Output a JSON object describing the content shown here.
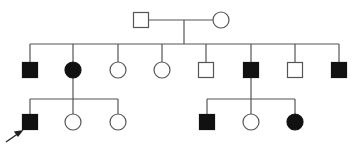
{
  "diagram": {
    "type": "pedigree",
    "colors": {
      "line": "#555555",
      "affected": "#111111",
      "unaffected_fill": "#ffffff",
      "background": "#ffffff"
    },
    "generations": [
      {
        "id": "I",
        "individuals": [
          {
            "id": "I-1",
            "sex": "male",
            "affected": false,
            "x": 141,
            "y": 20
          },
          {
            "id": "I-2",
            "sex": "female",
            "affected": false,
            "x": 221,
            "y": 20
          }
        ]
      },
      {
        "id": "II",
        "individuals": [
          {
            "id": "II-1",
            "sex": "male",
            "affected": true,
            "x": 30,
            "y": 70
          },
          {
            "id": "II-2",
            "sex": "female",
            "affected": true,
            "x": 73,
            "y": 70
          },
          {
            "id": "II-3",
            "sex": "female",
            "affected": false,
            "x": 118,
            "y": 70
          },
          {
            "id": "II-4",
            "sex": "female",
            "affected": false,
            "x": 162,
            "y": 70
          },
          {
            "id": "II-5",
            "sex": "male",
            "affected": false,
            "x": 206,
            "y": 70
          },
          {
            "id": "II-6",
            "sex": "male",
            "affected": true,
            "x": 251,
            "y": 70
          },
          {
            "id": "II-7",
            "sex": "male",
            "affected": false,
            "x": 295,
            "y": 70
          },
          {
            "id": "II-8",
            "sex": "male",
            "affected": true,
            "x": 339,
            "y": 70
          }
        ]
      },
      {
        "id": "III",
        "individuals": [
          {
            "id": "III-1",
            "sex": "male",
            "affected": true,
            "proband": true,
            "x": 30,
            "y": 122
          },
          {
            "id": "III-2",
            "sex": "female",
            "affected": false,
            "x": 73,
            "y": 122
          },
          {
            "id": "III-3",
            "sex": "female",
            "affected": false,
            "x": 118,
            "y": 122
          },
          {
            "id": "III-4",
            "sex": "male",
            "affected": true,
            "x": 207,
            "y": 122
          },
          {
            "id": "III-5",
            "sex": "female",
            "affected": false,
            "x": 251,
            "y": 122
          },
          {
            "id": "III-6",
            "sex": "female",
            "affected": true,
            "x": 295,
            "y": 122
          }
        ]
      }
    ],
    "unions": [
      {
        "partners": [
          "I-1",
          "I-2"
        ],
        "children": [
          "II-1",
          "II-2",
          "II-3",
          "II-4",
          "II-5",
          "II-6",
          "II-7",
          "II-8"
        ]
      },
      {
        "parent": "II-2",
        "children": [
          "III-1",
          "III-2",
          "III-3"
        ]
      },
      {
        "parent": "II-6",
        "children": [
          "III-4",
          "III-5",
          "III-6"
        ]
      }
    ],
    "proband_marker": {
      "target": "III-1",
      "symbol": "arrow"
    }
  }
}
